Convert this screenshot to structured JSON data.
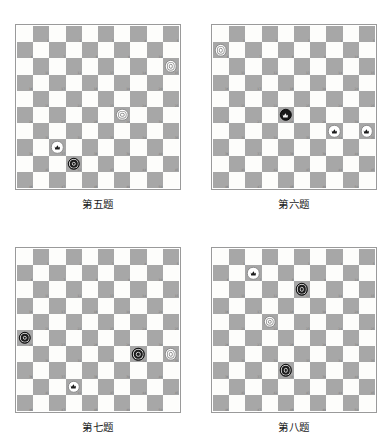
{
  "page": {
    "background_color": "#ffffff",
    "board_count": 4,
    "board_size": 10,
    "colors": {
      "light_square": "#fdfdfb",
      "dark_square": "#a7a7a7",
      "board_border": "#9a9a9a",
      "square_number": "#7d7d7d",
      "white_piece": "#ffffff",
      "black_piece": "#1d1d1d",
      "caption_text": "#1a1a1a"
    },
    "square_numbers_shown_on": "dark",
    "square_number_range": [
      1,
      50
    ]
  },
  "boards": [
    {
      "id": "problem-5",
      "caption": "第五题",
      "pieces": [
        {
          "square": 15,
          "color": "white",
          "rank": "man"
        },
        {
          "square": 29,
          "color": "white",
          "rank": "man"
        },
        {
          "square": 37,
          "color": "white",
          "rank": "king"
        },
        {
          "square": 42,
          "color": "black",
          "rank": "man"
        }
      ]
    },
    {
      "id": "problem-6",
      "caption": "第六题",
      "pieces": [
        {
          "square": 6,
          "color": "white",
          "rank": "man"
        },
        {
          "square": 28,
          "color": "black",
          "rank": "king"
        },
        {
          "square": 34,
          "color": "white",
          "rank": "king"
        },
        {
          "square": 35,
          "color": "white",
          "rank": "king"
        }
      ]
    },
    {
      "id": "problem-7",
      "caption": "第七题",
      "pieces": [
        {
          "square": 26,
          "color": "black",
          "rank": "man"
        },
        {
          "square": 34,
          "color": "black",
          "rank": "man"
        },
        {
          "square": 35,
          "color": "white",
          "rank": "man"
        },
        {
          "square": 42,
          "color": "white",
          "rank": "king"
        }
      ]
    },
    {
      "id": "problem-8",
      "caption": "第八题",
      "pieces": [
        {
          "square": 7,
          "color": "white",
          "rank": "king"
        },
        {
          "square": 13,
          "color": "black",
          "rank": "man"
        },
        {
          "square": 22,
          "color": "white",
          "rank": "man"
        },
        {
          "square": 38,
          "color": "black",
          "rank": "man"
        }
      ]
    }
  ]
}
